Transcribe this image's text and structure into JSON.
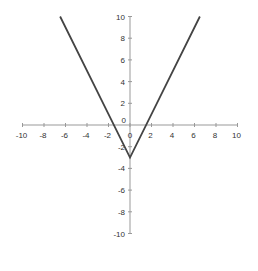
{
  "chart_data": {
    "type": "line",
    "title": "",
    "xlabel": "",
    "ylabel": "",
    "xlim": [
      -10,
      10
    ],
    "ylim": [
      -10,
      10
    ],
    "grid": false,
    "legend": null,
    "x_ticks": [
      -10,
      -8,
      -6,
      -4,
      -2,
      0,
      2,
      4,
      6,
      8,
      10
    ],
    "y_ticks": [
      -10,
      -8,
      -6,
      -4,
      -2,
      0,
      2,
      4,
      6,
      8,
      10
    ],
    "x_tick_labels": [
      "-10",
      "-8",
      "-6",
      "-4",
      "-2",
      "0",
      "2",
      "4",
      "6",
      "8",
      "10"
    ],
    "y_tick_labels": [
      "-10",
      "-8",
      "-6",
      "-4",
      "-2",
      "0",
      "2",
      "4",
      "6",
      "8",
      "10"
    ],
    "series": [
      {
        "name": "y = 2|x| - 3",
        "color": "#444444",
        "x": [
          -6.5,
          0,
          6.5
        ],
        "y": [
          10,
          -3,
          10
        ]
      }
    ],
    "annotations": [],
    "caption": "(cut off)"
  },
  "layout": {
    "origin_px": [
      130,
      125
    ],
    "x_unit_px": 10.75,
    "y_unit_px": 10.85,
    "axis_color": "#999999",
    "line_color": "#444444"
  }
}
